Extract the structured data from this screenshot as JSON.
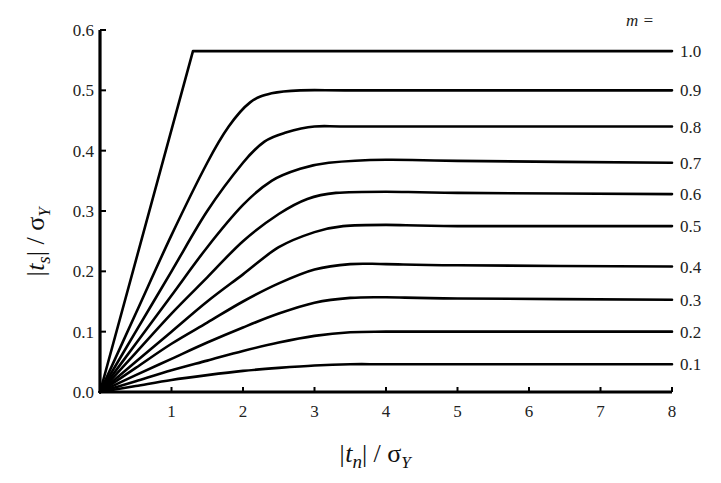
{
  "chart_data": {
    "type": "line",
    "title": "",
    "xlabel": "|t_n| / σ_Y",
    "ylabel": "|t_s| / σ_Y",
    "xlim": [
      0,
      8
    ],
    "ylim": [
      0,
      0.6
    ],
    "x_ticks": [
      1,
      2,
      3,
      4,
      5,
      6,
      7,
      8
    ],
    "y_ticks": [
      0.0,
      0.1,
      0.2,
      0.3,
      0.4,
      0.5,
      0.6
    ],
    "x_tick_labels": [
      "1",
      "2",
      "3",
      "4",
      "5",
      "6",
      "7",
      "8"
    ],
    "y_tick_labels": [
      "0.0",
      "0.1",
      "0.2",
      "0.3",
      "0.4",
      "0.5",
      "0.6"
    ],
    "grid": false,
    "legend_title": "m =",
    "legend_position": "right, inline at line ends",
    "series": [
      {
        "name": "1.0",
        "x": [
          0,
          1.3,
          8
        ],
        "values": [
          0,
          0.565,
          0.565
        ]
      },
      {
        "name": "0.9",
        "x": [
          0,
          0.5,
          1.0,
          1.5,
          1.8,
          2.1,
          2.4,
          2.8,
          3.5,
          5,
          8
        ],
        "values": [
          0,
          0.13,
          0.26,
          0.38,
          0.44,
          0.48,
          0.495,
          0.5,
          0.5,
          0.5,
          0.5
        ]
      },
      {
        "name": "0.8",
        "x": [
          0,
          0.5,
          1.0,
          1.5,
          2.0,
          2.3,
          2.6,
          3.0,
          3.5,
          5,
          8
        ],
        "values": [
          0,
          0.1,
          0.2,
          0.3,
          0.38,
          0.415,
          0.43,
          0.44,
          0.44,
          0.44,
          0.44
        ]
      },
      {
        "name": "0.7",
        "x": [
          0,
          0.5,
          1.0,
          1.5,
          2.0,
          2.4,
          2.8,
          3.2,
          4,
          5,
          8
        ],
        "values": [
          0,
          0.08,
          0.16,
          0.24,
          0.31,
          0.35,
          0.37,
          0.38,
          0.385,
          0.383,
          0.38
        ]
      },
      {
        "name": "0.6",
        "x": [
          0,
          0.5,
          1.0,
          1.5,
          2.0,
          2.5,
          2.9,
          3.3,
          4,
          5,
          8
        ],
        "values": [
          0,
          0.065,
          0.13,
          0.19,
          0.25,
          0.295,
          0.32,
          0.33,
          0.332,
          0.33,
          0.328
        ]
      },
      {
        "name": "0.5",
        "x": [
          0,
          0.5,
          1.0,
          1.5,
          2.0,
          2.5,
          3.0,
          3.4,
          4,
          5,
          8
        ],
        "values": [
          0,
          0.05,
          0.1,
          0.15,
          0.195,
          0.24,
          0.265,
          0.275,
          0.277,
          0.275,
          0.275
        ]
      },
      {
        "name": "0.4",
        "x": [
          0,
          0.5,
          1.0,
          1.5,
          2.0,
          2.5,
          3.0,
          3.5,
          4,
          5,
          8
        ],
        "values": [
          0,
          0.04,
          0.08,
          0.115,
          0.15,
          0.18,
          0.203,
          0.212,
          0.212,
          0.21,
          0.208
        ]
      },
      {
        "name": "0.3",
        "x": [
          0,
          0.5,
          1.0,
          1.5,
          2.0,
          2.5,
          3.0,
          3.5,
          4,
          5,
          8
        ],
        "values": [
          0,
          0.028,
          0.055,
          0.082,
          0.107,
          0.13,
          0.148,
          0.156,
          0.157,
          0.155,
          0.153
        ]
      },
      {
        "name": "0.2",
        "x": [
          0,
          0.5,
          1.0,
          1.5,
          2.0,
          2.5,
          3.0,
          3.5,
          4,
          5,
          8
        ],
        "values": [
          0,
          0.018,
          0.036,
          0.052,
          0.068,
          0.082,
          0.093,
          0.099,
          0.1,
          0.1,
          0.1
        ]
      },
      {
        "name": "0.1",
        "x": [
          0,
          0.5,
          1.0,
          1.5,
          2.0,
          2.5,
          3.0,
          3.5,
          4,
          5,
          8
        ],
        "values": [
          0,
          0.01,
          0.02,
          0.028,
          0.035,
          0.04,
          0.044,
          0.046,
          0.046,
          0.046,
          0.046
        ]
      }
    ]
  },
  "layout": {
    "plot_left": 100,
    "plot_right": 672,
    "plot_top": 30,
    "plot_bottom": 392
  },
  "labels": {
    "legend_title": "m =",
    "xlabel_main": "|t",
    "xlabel_sub": "n",
    "xlabel_rest": "| / σ",
    "xlabel_sub2": "Y",
    "ylabel_main": "|t",
    "ylabel_sub": "s",
    "ylabel_rest": "| / σ",
    "ylabel_sub2": "Y"
  }
}
